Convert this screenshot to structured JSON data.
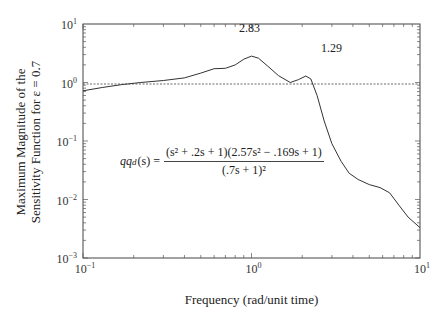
{
  "chart_data": {
    "type": "line",
    "title": "",
    "xlabel": "Frequency (rad/unit time)",
    "ylabel": "Maximum Magnitude of the Sensitivity Function for ε = 0.7",
    "xscale": "log",
    "yscale": "log",
    "xlim": [
      0.1,
      10
    ],
    "ylim": [
      0.001,
      10
    ],
    "x_ticks": [
      "10^-1",
      "10^0",
      "10^1"
    ],
    "y_ticks": [
      "10^-3",
      "10^-2",
      "10^-1",
      "10^0",
      "10^1"
    ],
    "grid": false,
    "reference_line": {
      "y": 1.0,
      "style": "dashed"
    },
    "series": [
      {
        "name": "sensitivity magnitude",
        "x": [
          0.1,
          0.13,
          0.17,
          0.22,
          0.3,
          0.4,
          0.5,
          0.6,
          0.7,
          0.8,
          0.9,
          1.0,
          1.1,
          1.25,
          1.45,
          1.7,
          1.9,
          2.1,
          2.25,
          2.45,
          2.7,
          3.0,
          3.4,
          3.8,
          4.3,
          5.0,
          5.8,
          6.6,
          7.5,
          8.5,
          10.0
        ],
        "values": [
          0.72,
          0.82,
          0.92,
          1.0,
          1.08,
          1.2,
          1.45,
          1.72,
          1.75,
          2.0,
          2.5,
          2.83,
          2.6,
          1.9,
          1.3,
          1.0,
          1.12,
          1.29,
          1.15,
          0.6,
          0.22,
          0.09,
          0.045,
          0.028,
          0.022,
          0.018,
          0.016,
          0.013,
          0.008,
          0.005,
          0.0033
        ]
      }
    ],
    "annotations": [
      {
        "text": "2.83",
        "x": 1.0,
        "y": 2.83
      },
      {
        "text": "1.29",
        "x": 2.1,
        "y": 1.29
      },
      {
        "text": "qq_d(s) = (s^2 + .2s + 1)(2.57s^2 − .169s + 1) / (.7s + 1)^2",
        "x": 0.13,
        "y": 0.025
      }
    ]
  },
  "labels": {
    "ylabel_line1": "Maximum Magnitude of the",
    "ylabel_line2": "Sensitivity Function for ε = 0.7",
    "xlabel": "Frequency (rad/unit time)",
    "peak1": "2.83",
    "peak2": "1.29",
    "formula_lhs": "qq",
    "formula_sub": "d",
    "formula_arg": "(s) =",
    "formula_num": "(s² + .2s + 1)(2.57s² − .169s + 1)",
    "formula_den": "(.7s + 1)²"
  },
  "ticks": {
    "y": [
      "10",
      "10",
      "10",
      "10",
      "10"
    ],
    "y_exp": [
      "1",
      "0",
      "−1",
      "−2",
      "−3"
    ],
    "x": [
      "10",
      "10",
      "10"
    ],
    "x_exp": [
      "−1",
      "0",
      "1"
    ]
  }
}
